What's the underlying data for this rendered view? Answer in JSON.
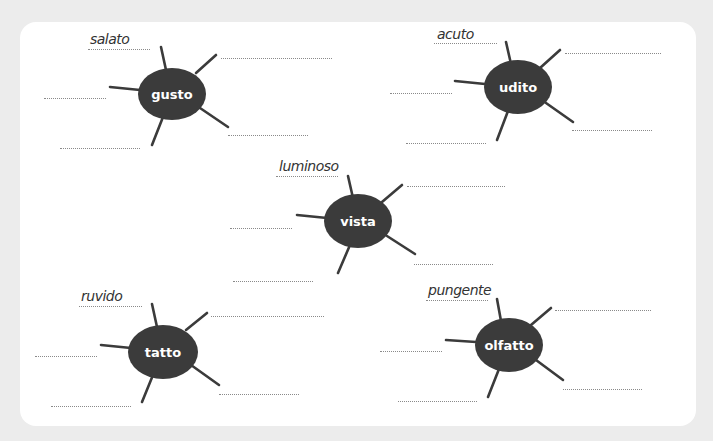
{
  "worksheet": {
    "background_color": "#ececec",
    "card_color": "#ffffff",
    "node_color": "#3b3b3b",
    "nodes": [
      {
        "id": "gusto",
        "label": "gusto",
        "example": "salato",
        "cx": 172,
        "cy": 94,
        "example_pos": {
          "x": 90,
          "y": 30
        },
        "blanks": [
          {
            "x": 88,
            "y": 49,
            "w": 62,
            "filled": true
          },
          {
            "x": 221,
            "y": 58,
            "w": 111
          },
          {
            "x": 44,
            "y": 98,
            "w": 62
          },
          {
            "x": 228,
            "y": 135,
            "w": 80
          },
          {
            "x": 60,
            "y": 148,
            "w": 80
          }
        ]
      },
      {
        "id": "udito",
        "label": "udito",
        "example": "acuto",
        "cx": 518,
        "cy": 87,
        "example_pos": {
          "x": 437,
          "y": 26
        },
        "blanks": [
          {
            "x": 434,
            "y": 43,
            "w": 63,
            "filled": true
          },
          {
            "x": 565,
            "y": 53,
            "w": 96
          },
          {
            "x": 390,
            "y": 93,
            "w": 62
          },
          {
            "x": 572,
            "y": 130,
            "w": 80
          },
          {
            "x": 406,
            "y": 143,
            "w": 80
          }
        ]
      },
      {
        "id": "vista",
        "label": "vista",
        "example": "luminoso",
        "cx": 358,
        "cy": 221,
        "example_pos": {
          "x": 279,
          "y": 157
        },
        "blanks": [
          {
            "x": 276,
            "y": 176,
            "w": 62,
            "filled": true
          },
          {
            "x": 407,
            "y": 186,
            "w": 98
          },
          {
            "x": 230,
            "y": 228,
            "w": 62
          },
          {
            "x": 414,
            "y": 264,
            "w": 79
          },
          {
            "x": 233,
            "y": 281,
            "w": 80
          }
        ]
      },
      {
        "id": "tatto",
        "label": "tatto",
        "example": "ruvido",
        "cx": 163,
        "cy": 352,
        "example_pos": {
          "x": 81,
          "y": 288
        },
        "blanks": [
          {
            "x": 79,
            "y": 306,
            "w": 63,
            "filled": true
          },
          {
            "x": 211,
            "y": 316,
            "w": 113
          },
          {
            "x": 35,
            "y": 356,
            "w": 62
          },
          {
            "x": 219,
            "y": 394,
            "w": 80
          },
          {
            "x": 51,
            "y": 406,
            "w": 80
          }
        ]
      },
      {
        "id": "olfatto",
        "label": "olfatto",
        "example": "pungente",
        "cx": 509,
        "cy": 345,
        "example_pos": {
          "x": 428,
          "y": 282
        },
        "blanks": [
          {
            "x": 426,
            "y": 300,
            "w": 62,
            "filled": true
          },
          {
            "x": 555,
            "y": 310,
            "w": 96
          },
          {
            "x": 380,
            "y": 351,
            "w": 62
          },
          {
            "x": 563,
            "y": 389,
            "w": 79
          },
          {
            "x": 398,
            "y": 401,
            "w": 79
          }
        ]
      }
    ]
  }
}
